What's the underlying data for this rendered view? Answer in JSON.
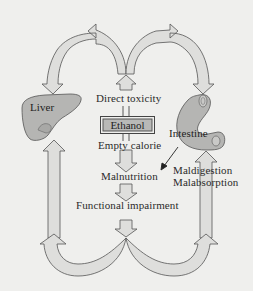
{
  "diagram": {
    "center_box": "Ethanol",
    "labels": {
      "direct_toxicity": "Direct toxicity",
      "empty_calorie": "Empty calorie",
      "malnutrition": "Malnutrition",
      "functional_impairment": "Functional impairment",
      "maldigestion": "Maldigestion",
      "malabsorption": "Malabsorption"
    },
    "organs": {
      "liver": "Liver",
      "intestine": "Intestine"
    },
    "colors": {
      "background": "#efefed",
      "arrow_fill": "#dededc",
      "arrow_stroke": "#555555",
      "organ_fill": "#b5b5b3",
      "box_fill": "#b9b9b7"
    }
  }
}
